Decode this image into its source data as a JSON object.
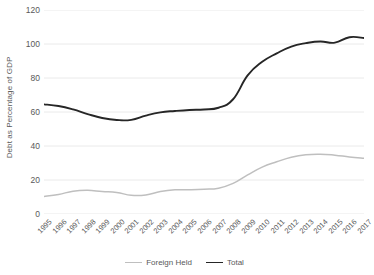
{
  "chart_data": {
    "type": "line",
    "title": "",
    "subtitle": "",
    "xlabel": "",
    "ylabel": "Debt as Percentage of GDP",
    "x": [
      1995,
      1996,
      1997,
      1998,
      1999,
      2000,
      2001,
      2002,
      2003,
      2004,
      2005,
      2006,
      2007,
      2008,
      2009,
      2010,
      2011,
      2012,
      2013,
      2014,
      2015,
      2016,
      2017
    ],
    "xtick_labels": [
      "1995",
      "1996",
      "1997",
      "1998",
      "1999",
      "2000",
      "2001",
      "2002",
      "2003",
      "2004",
      "2005",
      "2006",
      "2007",
      "2008",
      "2009",
      "2010",
      "2011",
      "2012",
      "2013",
      "2014",
      "2015",
      "2016",
      "2017"
    ],
    "ytick_labels": [
      "0",
      "20",
      "40",
      "60",
      "80",
      "100",
      "120"
    ],
    "yticks": [
      0,
      20,
      40,
      60,
      80,
      100,
      120
    ],
    "ylim": [
      0,
      120
    ],
    "xlim": [
      1995,
      2017
    ],
    "grid": "horizontal",
    "legend_position": "bottom",
    "series": [
      {
        "name": "Foreign Held",
        "color": "#bfbfbf",
        "values": [
          10.3,
          11.5,
          13.4,
          13.9,
          13.2,
          12.7,
          11.0,
          11.2,
          13.2,
          14.2,
          14.3,
          14.6,
          15.2,
          18.0,
          23.0,
          27.6,
          30.7,
          33.4,
          34.9,
          35.2,
          34.6,
          33.6,
          32.8
        ]
      },
      {
        "name": "Total",
        "color": "#262626",
        "values": [
          64.5,
          63.5,
          61.5,
          58.8,
          56.5,
          55.3,
          55.4,
          57.9,
          59.8,
          60.6,
          61.2,
          61.5,
          62.5,
          67.5,
          81.5,
          89.5,
          94.5,
          98.5,
          100.5,
          101.5,
          100.8,
          104.0,
          103.5
        ]
      }
    ]
  },
  "legend": {
    "items": [
      {
        "label": "Foreign Held",
        "color": "#bfbfbf"
      },
      {
        "label": "Total",
        "color": "#262626"
      }
    ]
  },
  "colors": {
    "background": "#ffffff",
    "gridline": "#e8e8e8",
    "axis_text": "#595959",
    "foreign_held": "#bfbfbf",
    "total": "#262626"
  }
}
